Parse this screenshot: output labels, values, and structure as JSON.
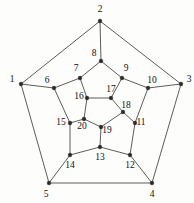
{
  "figure": {
    "background_color": "#fdfdfc",
    "edge_color": "#4a4a4a",
    "node_color": "#2a2a2a",
    "label_color": "#111111"
  },
  "graph_data": {
    "type": "graph",
    "layout": "planar-pentagonal",
    "node_count": 20,
    "edge_count": 30,
    "nodes": [
      {
        "id": 1,
        "label": "1",
        "x": 21,
        "y": 84,
        "lx": 12,
        "ly": 80,
        "ring": "outer"
      },
      {
        "id": 2,
        "label": "2",
        "x": 100,
        "y": 21,
        "lx": 100,
        "ly": 10,
        "ring": "outer"
      },
      {
        "id": 3,
        "label": "3",
        "x": 181,
        "y": 84,
        "lx": 189,
        "ly": 80,
        "ring": "outer"
      },
      {
        "id": 4,
        "label": "4",
        "x": 152,
        "y": 183,
        "lx": 152,
        "ly": 195,
        "ring": "outer"
      },
      {
        "id": 5,
        "label": "5",
        "x": 49,
        "y": 183,
        "lx": 46,
        "ly": 195,
        "ring": "outer"
      },
      {
        "id": 6,
        "label": "6",
        "x": 54,
        "y": 88,
        "lx": 47,
        "ly": 81,
        "ring": "middle"
      },
      {
        "id": 7,
        "label": "7",
        "x": 80,
        "y": 78,
        "lx": 76,
        "ly": 69,
        "ring": "middle"
      },
      {
        "id": 8,
        "label": "8",
        "x": 101,
        "y": 61,
        "lx": 94,
        "ly": 54,
        "ring": "middle"
      },
      {
        "id": 9,
        "label": "9",
        "x": 122,
        "y": 78,
        "lx": 126,
        "ly": 69,
        "ring": "middle"
      },
      {
        "id": 10,
        "label": "10",
        "x": 148,
        "y": 88,
        "lx": 152,
        "ly": 81,
        "ring": "middle"
      },
      {
        "id": 11,
        "label": "11",
        "x": 135,
        "y": 123,
        "lx": 141,
        "ly": 123,
        "ring": "middle"
      },
      {
        "id": 12,
        "label": "12",
        "x": 130,
        "y": 155,
        "lx": 130,
        "ly": 166,
        "ring": "middle"
      },
      {
        "id": 13,
        "label": "13",
        "x": 100,
        "y": 147,
        "lx": 100,
        "ly": 158,
        "ring": "middle"
      },
      {
        "id": 14,
        "label": "14",
        "x": 70,
        "y": 155,
        "lx": 70,
        "ly": 166,
        "ring": "middle"
      },
      {
        "id": 15,
        "label": "15",
        "x": 70,
        "y": 123,
        "lx": 61,
        "ly": 123,
        "ring": "middle"
      },
      {
        "id": 16,
        "label": "16",
        "x": 87,
        "y": 98,
        "lx": 79,
        "ly": 97,
        "ring": "inner"
      },
      {
        "id": 17,
        "label": "17",
        "x": 111,
        "y": 98,
        "lx": 111,
        "ly": 90,
        "ring": "inner"
      },
      {
        "id": 18,
        "label": "18",
        "x": 123,
        "y": 112,
        "lx": 126,
        "ly": 106,
        "ring": "inner"
      },
      {
        "id": 19,
        "label": "19",
        "x": 101,
        "y": 127,
        "lx": 107,
        "ly": 131,
        "ring": "inner"
      },
      {
        "id": 20,
        "label": "20",
        "x": 84,
        "y": 119,
        "lx": 82,
        "ly": 127,
        "ring": "inner"
      }
    ],
    "edges": [
      [
        1,
        2
      ],
      [
        2,
        3
      ],
      [
        3,
        4
      ],
      [
        4,
        5
      ],
      [
        5,
        1
      ],
      [
        1,
        6
      ],
      [
        2,
        8
      ],
      [
        3,
        10
      ],
      [
        4,
        12
      ],
      [
        5,
        14
      ],
      [
        6,
        7
      ],
      [
        7,
        8
      ],
      [
        8,
        9
      ],
      [
        9,
        10
      ],
      [
        10,
        11
      ],
      [
        11,
        12
      ],
      [
        12,
        13
      ],
      [
        13,
        14
      ],
      [
        14,
        15
      ],
      [
        15,
        6
      ],
      [
        7,
        16
      ],
      [
        9,
        17
      ],
      [
        11,
        18
      ],
      [
        13,
        19
      ],
      [
        15,
        20
      ],
      [
        16,
        17
      ],
      [
        17,
        18
      ],
      [
        18,
        19
      ],
      [
        19,
        20
      ],
      [
        20,
        16
      ]
    ]
  }
}
